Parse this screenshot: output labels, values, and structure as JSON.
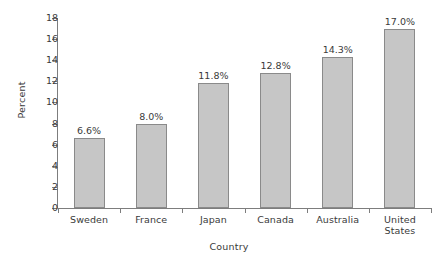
{
  "chart_data": {
    "type": "bar",
    "title": "",
    "xlabel": "Country",
    "ylabel": "Percent",
    "categories": [
      "Sweden",
      "France",
      "Japan",
      "Canada",
      "Australia",
      "United States"
    ],
    "category_lines": [
      [
        "Sweden"
      ],
      [
        "France"
      ],
      [
        "Japan"
      ],
      [
        "Canada"
      ],
      [
        "Australia"
      ],
      [
        "United",
        "States"
      ]
    ],
    "values": [
      6.6,
      8.0,
      11.8,
      12.8,
      14.3,
      17.0
    ],
    "data_labels": [
      "6.6%",
      "8.0%",
      "11.8%",
      "12.8%",
      "14.3%",
      "17.0%"
    ],
    "ylim": [
      0,
      18
    ],
    "ytick_values": [
      0,
      2,
      4,
      6,
      8,
      10,
      12,
      14,
      16,
      18
    ],
    "ytick_labels": [
      "0",
      "2",
      "4",
      "6",
      "8",
      "10",
      "12",
      "14",
      "16",
      "18"
    ],
    "grid": false,
    "legend": null,
    "bar_color": "#c6c6c6",
    "bar_border_color": "#8a8a8a",
    "axis_color": "#7d7d7d",
    "text_color": "#3a3a3a",
    "background": "#ffffff"
  }
}
